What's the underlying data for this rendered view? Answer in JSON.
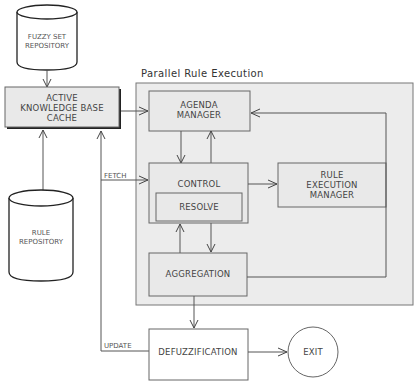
{
  "diagram": {
    "title": "Parallel Rule Execution",
    "colors": {
      "container_fill": "#ececec",
      "box_fill": "#e9e9e9",
      "stroke": "#555555",
      "text": "#444444"
    },
    "nodes": {
      "fuzzy_set_repository": {
        "line1": "FUZZY SET",
        "line2": "REPOSITORY",
        "shape": "cylinder"
      },
      "active_kb_cache": {
        "line1": "ACTIVE",
        "line2": "KNOWLEDGE BASE",
        "line3": "CACHE",
        "shape": "box"
      },
      "rule_repository": {
        "line1": "RULE",
        "line2": "REPOSITORY",
        "shape": "cylinder"
      },
      "agenda_manager": {
        "line1": "AGENDA",
        "line2": "MANAGER",
        "shape": "box"
      },
      "control": {
        "label": "CONTROL",
        "shape": "box"
      },
      "resolve": {
        "label": "RESOLVE",
        "shape": "box"
      },
      "rule_execution_manager": {
        "line1": "RULE",
        "line2": "EXECUTION",
        "line3": "MANAGER",
        "shape": "box"
      },
      "aggregation": {
        "label": "AGGREGATION",
        "shape": "box"
      },
      "defuzzification": {
        "label": "DEFUZZIFICATION",
        "shape": "box"
      },
      "exit": {
        "label": "EXIT",
        "shape": "ellipse"
      }
    },
    "edge_labels": {
      "fetch": "FETCH",
      "update": "UPDATE"
    },
    "edges": [
      {
        "from": "FUZZY SET REPOSITORY",
        "to": "ACTIVE KNOWLEDGE BASE CACHE"
      },
      {
        "from": "RULE REPOSITORY",
        "to": "ACTIVE KNOWLEDGE BASE CACHE"
      },
      {
        "from": "ACTIVE KNOWLEDGE BASE CACHE",
        "to": "AGENDA MANAGER"
      },
      {
        "from": "ACTIVE KNOWLEDGE BASE CACHE",
        "to": "CONTROL",
        "label": "FETCH"
      },
      {
        "from": "AGENDA MANAGER",
        "to": "CONTROL"
      },
      {
        "from": "CONTROL",
        "to": "AGENDA MANAGER"
      },
      {
        "from": "CONTROL",
        "to": "RULE EXECUTION MANAGER"
      },
      {
        "from": "CONTROL",
        "to": "AGGREGATION"
      },
      {
        "from": "AGGREGATION",
        "to": "CONTROL"
      },
      {
        "from": "AGGREGATION",
        "to": "AGENDA MANAGER"
      },
      {
        "from": "AGGREGATION",
        "to": "DEFUZZIFICATION"
      },
      {
        "from": "DEFUZZIFICATION",
        "to": "ACTIVE KNOWLEDGE BASE CACHE",
        "label": "UPDATE"
      },
      {
        "from": "DEFUZZIFICATION",
        "to": "EXIT"
      }
    ]
  }
}
